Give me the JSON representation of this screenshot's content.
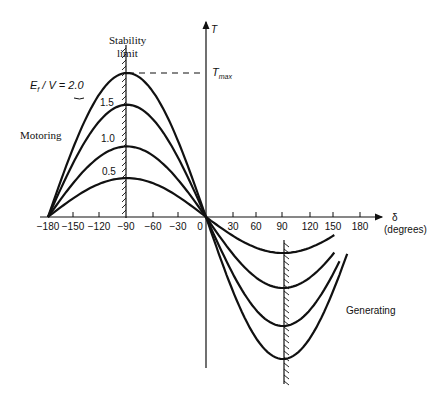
{
  "chart_data": {
    "type": "line",
    "xlabel": "δ (degrees)",
    "ylabel": "T",
    "x_ticks": [
      -180,
      -150,
      -120,
      -90,
      -60,
      -30,
      0,
      30,
      60,
      90,
      120,
      150,
      180
    ],
    "xlim": [
      -180,
      180
    ],
    "ylim_relative": [
      -1.0,
      1.0
    ],
    "series": [
      {
        "name": "Ef/V = 0.5",
        "label": "0.5",
        "amplitude_relative": 0.27
      },
      {
        "name": "Ef/V = 1.0",
        "label": "1.0",
        "amplitude_relative": 0.49
      },
      {
        "name": "Ef/V = 1.5",
        "label": "1.5",
        "amplitude_relative": 0.78
      },
      {
        "name": "Ef/V = 2.0",
        "label": "E_f / V = 2.0",
        "amplitude_relative": 1.0
      }
    ],
    "annotations": [
      "Stability limit",
      "T_max",
      "Motoring",
      "Generating"
    ],
    "stability_limits_deg": [
      -90,
      90
    ],
    "grid": false,
    "legend": "inline labels"
  },
  "labels": {
    "stability": "Stability",
    "limit": "limit",
    "ratio_main": "E",
    "ratio_sub": "f",
    "ratio_rest": " / V = 2.0",
    "l15": "1.5",
    "l10": "1.0",
    "l05": "0.5",
    "tmax_main": "T",
    "tmax_sub": "max",
    "t_axis": "T",
    "motoring": "Motoring",
    "generating": "Generating",
    "delta": "δ",
    "degrees": "(degrees)"
  },
  "ticks": {
    "n180": "−180",
    "n150": "−150",
    "n120": "−120",
    "n90": "−90",
    "n60": "−60",
    "n30": "−30",
    "z": "0",
    "p30": "30",
    "p60": "60",
    "p90": "90",
    "p120": "120",
    "p150": "150",
    "p180": "180"
  }
}
